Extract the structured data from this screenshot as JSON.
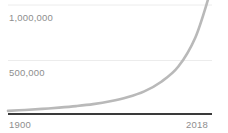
{
  "chart_data": {
    "type": "line",
    "title": "",
    "subtitle": "",
    "xlabel": "",
    "ylabel": "",
    "xlim": [
      1900,
      2018
    ],
    "ylim": [
      0,
      1000000
    ],
    "grid": true,
    "legend": null,
    "y_ticks": [
      {
        "value": 500000,
        "label": "500,000"
      },
      {
        "value": 1000000,
        "label": "1,000,000"
      }
    ],
    "x_ticks": [
      {
        "value": 1900,
        "label": "1900"
      },
      {
        "value": 2018,
        "label": "2018"
      }
    ],
    "series": [
      {
        "name": "Total",
        "color": "#b9b9b9",
        "x": [
          1900,
          1910,
          1920,
          1930,
          1940,
          1950,
          1960,
          1970,
          1980,
          1990,
          2000,
          2010,
          2018
        ],
        "values": [
          20000,
          28000,
          38000,
          50000,
          64000,
          82000,
          108000,
          145000,
          200000,
          290000,
          430000,
          700000,
          1080000
        ]
      }
    ],
    "axis_color": "#3a3a3a",
    "gridline_color": "#ececec",
    "tick_label_color": "#8e8e8e",
    "background_color": "#ffffff"
  },
  "axes": {
    "y_top_label": "1,000,000",
    "y_mid_label": "500,000",
    "x_start_label": "1900",
    "x_end_label": "2018"
  }
}
